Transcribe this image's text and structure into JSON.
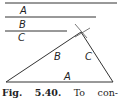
{
  "segments": {
    "a": {
      "label": "A"
    },
    "b": {
      "label": "B"
    },
    "c": {
      "label": "C"
    }
  },
  "triangle": {
    "side_a_label": "A",
    "side_b_label": "B",
    "side_c_label": "C"
  },
  "caption": {
    "fig": "Fig.",
    "number": "5.40.",
    "word1": "To",
    "word2": "con-"
  }
}
